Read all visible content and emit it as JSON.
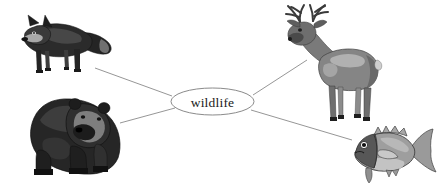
{
  "diagram": {
    "type": "word-web",
    "background_color": "#ffffff",
    "center": {
      "label": "wildlife",
      "shape": "ellipse",
      "cx": 212.5,
      "cy": 101.5,
      "rx": 41.5,
      "ry": 13.5,
      "fill": "#ffffff",
      "stroke": "#7d7d7d"
    },
    "connector_color": "#8a8a8a",
    "connectors": [
      {
        "name": "connector-to-fox",
        "x1": 172,
        "y1": 96,
        "x2": 95,
        "y2": 68
      },
      {
        "name": "connector-to-deer",
        "x1": 253,
        "y1": 95,
        "x2": 307,
        "y2": 60
      },
      {
        "name": "connector-to-bear",
        "x1": 175,
        "y1": 108,
        "x2": 120,
        "y2": 123
      },
      {
        "name": "connector-to-fish",
        "x1": 251,
        "y1": 110,
        "x2": 352,
        "y2": 140
      }
    ],
    "nodes": [
      {
        "name": "fox",
        "label": "fox",
        "position": "top-left",
        "icon": "fox-illustration"
      },
      {
        "name": "deer",
        "label": "deer",
        "position": "top-right",
        "icon": "deer-illustration"
      },
      {
        "name": "bear",
        "label": "bear",
        "position": "bottom-left",
        "icon": "bear-illustration"
      },
      {
        "name": "fish",
        "label": "fish",
        "position": "bottom-right",
        "icon": "fish-illustration"
      }
    ],
    "palette": {
      "fox_dark": "#2e2e2e",
      "fox_mid": "#5a5a5a",
      "fox_light": "#9c9c9c",
      "deer_dark": "#4a4a4a",
      "deer_mid": "#7e7e7e",
      "deer_light": "#b4b4b4",
      "bear_dark": "#1f1f1f",
      "bear_mid": "#3c3c3c",
      "bear_light": "#8d8d8d",
      "fish_dark": "#4f4f4f",
      "fish_mid": "#8e8e8e",
      "fish_light": "#bdbdbd",
      "outline": "#2b2b2b"
    }
  }
}
